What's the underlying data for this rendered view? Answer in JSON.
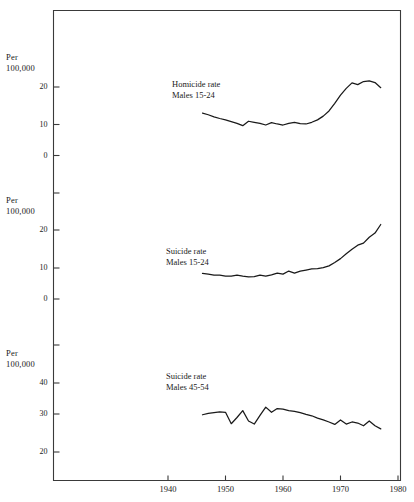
{
  "figure": {
    "background_color": "#ffffff",
    "line_color": "#1a1a1a",
    "axis_color": "#3a3a3a"
  },
  "axis": {
    "unit_line1": "Per",
    "unit_line2": "100,000",
    "x_ticks": [
      "1940",
      "1950",
      "1960",
      "1970",
      "1980"
    ]
  },
  "panels": [
    {
      "title_line1": "Homicide rate",
      "title_line2": "Males 15-24",
      "y_ticks": [
        "20",
        "10",
        "0"
      ]
    },
    {
      "title_line1": "Suicide rate",
      "title_line2": "Males 15-24",
      "y_ticks": [
        "20",
        "10",
        "0"
      ]
    },
    {
      "title_line1": "Suicide rate",
      "title_line2": "Males 45-54",
      "y_ticks": [
        "40",
        "30",
        "20"
      ]
    }
  ],
  "chart_data": {
    "type": "line",
    "title": "",
    "xlabel": "",
    "ylabel": "Per 100,000",
    "xlim": [
      1936,
      1982
    ],
    "grid": false,
    "legend": "inline-annotation",
    "panels": [
      {
        "name": "Homicide rate Males 15-24",
        "ylabel": "Per 100,000",
        "ylim": [
          0,
          25
        ],
        "yticks": [
          0,
          10,
          20
        ],
        "x": [
          1946,
          1947,
          1948,
          1949,
          1950,
          1951,
          1952,
          1953,
          1954,
          1955,
          1956,
          1957,
          1958,
          1959,
          1960,
          1961,
          1962,
          1963,
          1964,
          1965,
          1966,
          1967,
          1968,
          1969,
          1970,
          1971,
          1972,
          1973,
          1974,
          1975,
          1976,
          1977
        ],
        "values": [
          12.4,
          11.9,
          11.3,
          10.8,
          10.4,
          9.9,
          9.4,
          8.7,
          10.0,
          9.7,
          9.4,
          8.9,
          9.6,
          9.2,
          8.9,
          9.4,
          9.7,
          9.3,
          9.2,
          9.7,
          10.4,
          11.5,
          13.0,
          15.2,
          17.6,
          19.6,
          21.2,
          20.7,
          21.6,
          21.8,
          21.3,
          19.8
        ]
      },
      {
        "name": "Suicide rate Males 15-24",
        "ylabel": "Per 100,000",
        "ylim": [
          0,
          25
        ],
        "yticks": [
          0,
          10,
          20
        ],
        "x": [
          1946,
          1947,
          1948,
          1949,
          1950,
          1951,
          1952,
          1953,
          1954,
          1955,
          1956,
          1957,
          1958,
          1959,
          1960,
          1961,
          1962,
          1963,
          1964,
          1965,
          1966,
          1967,
          1968,
          1969,
          1970,
          1971,
          1972,
          1973,
          1974,
          1975,
          1976,
          1977
        ],
        "values": [
          7.4,
          7.2,
          6.9,
          6.9,
          6.6,
          6.6,
          6.9,
          6.6,
          6.4,
          6.5,
          6.9,
          6.6,
          7.0,
          7.5,
          7.2,
          8.1,
          7.5,
          8.1,
          8.4,
          8.7,
          8.8,
          9.1,
          9.6,
          10.6,
          11.7,
          13.1,
          14.4,
          15.6,
          16.2,
          17.9,
          19.1,
          21.6
        ]
      },
      {
        "name": "Suicide rate Males 45-54",
        "ylabel": "Per 100,000",
        "ylim": [
          18,
          45
        ],
        "yticks": [
          20,
          30,
          40
        ],
        "x": [
          1946,
          1947,
          1948,
          1949,
          1950,
          1951,
          1952,
          1953,
          1954,
          1955,
          1956,
          1957,
          1958,
          1959,
          1960,
          1961,
          1962,
          1963,
          1964,
          1965,
          1966,
          1967,
          1968,
          1969,
          1970,
          1971,
          1972,
          1973,
          1974,
          1975,
          1976,
          1977
        ],
        "values": [
          30.8,
          31.2,
          31.4,
          31.6,
          31.5,
          28.2,
          30.0,
          32.0,
          29.0,
          28.1,
          30.6,
          33.0,
          31.5,
          32.6,
          32.4,
          32.0,
          31.8,
          31.4,
          30.9,
          30.5,
          29.8,
          29.3,
          28.7,
          28.0,
          29.3,
          28.1,
          28.7,
          28.4,
          27.6,
          29.0,
          27.6,
          26.7
        ]
      }
    ]
  }
}
